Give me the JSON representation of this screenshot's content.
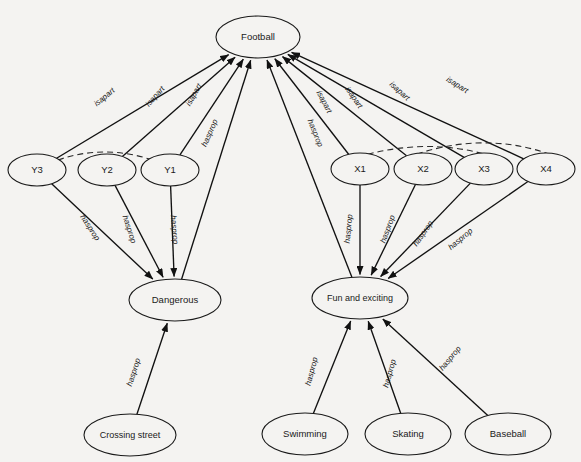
{
  "diagram": {
    "background_color": "#f4f3f1",
    "stroke_color": "#111111",
    "nodes": [
      {
        "id": "football",
        "label": "Football",
        "cx": 258,
        "cy": 37,
        "rx": 42,
        "ry": 21
      },
      {
        "id": "y3",
        "label": "Y3",
        "cx": 37,
        "cy": 170,
        "rx": 29,
        "ry": 16
      },
      {
        "id": "y2",
        "label": "Y2",
        "cx": 107,
        "cy": 170,
        "rx": 29,
        "ry": 16
      },
      {
        "id": "y1",
        "label": "Y1",
        "cx": 170,
        "cy": 170,
        "rx": 29,
        "ry": 16
      },
      {
        "id": "x1",
        "label": "X1",
        "cx": 360,
        "cy": 169,
        "rx": 29,
        "ry": 16
      },
      {
        "id": "x2",
        "label": "X2",
        "cx": 423,
        "cy": 169,
        "rx": 29,
        "ry": 16
      },
      {
        "id": "x3",
        "label": "X3",
        "cx": 484,
        "cy": 169,
        "rx": 29,
        "ry": 16
      },
      {
        "id": "x4",
        "label": "X4",
        "cx": 546,
        "cy": 169,
        "rx": 29,
        "ry": 16
      },
      {
        "id": "dangerous",
        "label": "Dangerous",
        "cx": 175,
        "cy": 300,
        "rx": 46,
        "ry": 21
      },
      {
        "id": "fun",
        "label": "Fun and exciting",
        "cx": 360,
        "cy": 298,
        "rx": 48,
        "ry": 21
      },
      {
        "id": "crossing-street",
        "label": "Crossing street",
        "cx": 130,
        "cy": 435,
        "rx": 46,
        "ry": 21
      },
      {
        "id": "swimming",
        "label": "Swimming",
        "cx": 305,
        "cy": 434,
        "rx": 43,
        "ry": 21
      },
      {
        "id": "skating",
        "label": "Skating",
        "cx": 408,
        "cy": 434,
        "rx": 43,
        "ry": 21
      },
      {
        "id": "baseball",
        "label": "Baseball",
        "cx": 508,
        "cy": 434,
        "rx": 43,
        "ry": 21
      }
    ],
    "edges": [
      {
        "id": "y3-football",
        "from": "y3",
        "to": "football",
        "label": "isapart",
        "lx": 106,
        "ly": 99,
        "angle": -39
      },
      {
        "id": "y2-football",
        "from": "y2",
        "to": "football",
        "label": "isapart",
        "lx": 157,
        "ly": 98,
        "angle": -48
      },
      {
        "id": "y1-football",
        "from": "y1",
        "to": "football",
        "label": "isapart",
        "lx": 196,
        "ly": 96,
        "angle": -60
      },
      {
        "id": "dangerous-football",
        "from": "dangerous",
        "to": "football",
        "label": "hasprop",
        "lx": 212,
        "ly": 134,
        "angle": -66
      },
      {
        "id": "fun-football",
        "from": "fun",
        "to": "football",
        "label": "hasprop",
        "lx": 313,
        "ly": 134,
        "angle": 68
      },
      {
        "id": "x1-football",
        "from": "x1",
        "to": "football",
        "label": "isapart",
        "lx": 322,
        "ly": 103,
        "angle": 62
      },
      {
        "id": "x2-football",
        "from": "x2",
        "to": "football",
        "label": "isapart",
        "lx": 352,
        "ly": 99,
        "angle": 55
      },
      {
        "id": "x3-football",
        "from": "x3",
        "to": "football",
        "label": "isapart",
        "lx": 398,
        "ly": 93,
        "angle": 42
      },
      {
        "id": "x4-football",
        "from": "x4",
        "to": "football",
        "label": "isapart",
        "lx": 456,
        "ly": 87,
        "angle": 32
      },
      {
        "id": "y3-dangerous",
        "from": "y3",
        "to": "dangerous",
        "label": "hasprop",
        "lx": 88,
        "ly": 229,
        "angle": 57
      },
      {
        "id": "y2-dangerous",
        "from": "y2",
        "to": "dangerous",
        "label": "hasprop",
        "lx": 127,
        "ly": 230,
        "angle": 72
      },
      {
        "id": "y1-dangerous",
        "from": "y1",
        "to": "dangerous",
        "label": "hasprop",
        "lx": 172,
        "ly": 230,
        "angle": 85
      },
      {
        "id": "x1-fun",
        "from": "x1",
        "to": "fun",
        "label": "hasprop",
        "lx": 351,
        "ly": 229,
        "angle": -84
      },
      {
        "id": "x2-fun",
        "from": "x2",
        "to": "fun",
        "label": "hasprop",
        "lx": 390,
        "ly": 230,
        "angle": -70
      },
      {
        "id": "x3-fun",
        "from": "x3",
        "to": "fun",
        "label": "hasprop",
        "lx": 425,
        "ly": 235,
        "angle": -55
      },
      {
        "id": "x4-fun",
        "from": "x4",
        "to": "fun",
        "label": "hasprop",
        "lx": 462,
        "ly": 241,
        "angle": -40
      },
      {
        "id": "crossing-dangerous",
        "from": "crossing-street",
        "to": "dangerous",
        "label": "hasprop",
        "lx": 136,
        "ly": 373,
        "angle": -72
      },
      {
        "id": "swimming-fun",
        "from": "swimming",
        "to": "fun",
        "label": "hasprop",
        "lx": 314,
        "ly": 372,
        "angle": -75
      },
      {
        "id": "skating-fun",
        "from": "skating",
        "to": "fun",
        "label": "hasprop",
        "lx": 392,
        "ly": 374,
        "angle": -74
      },
      {
        "id": "baseball-fun",
        "from": "baseball",
        "to": "fun",
        "label": "hasprop",
        "lx": 452,
        "ly": 360,
        "angle": -50
      }
    ],
    "dashed_arcs": [
      {
        "id": "arc-y3-y1",
        "from": "y3",
        "to": "y1",
        "d": "M 58 160 Q 107 143 158 162"
      },
      {
        "id": "arc-x1-x3",
        "from": "x1",
        "to": "x3",
        "d": "M 339 163 Q 420 134 491 156"
      },
      {
        "id": "arc-x2-x4",
        "from": "x2",
        "to": "x4",
        "d": "M 398 161 Q 478 128 552 155"
      }
    ]
  }
}
